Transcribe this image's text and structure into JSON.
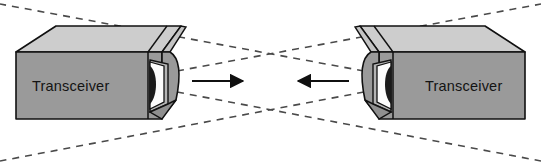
{
  "figure": {
    "width": 541,
    "height": 166,
    "background_color": "#ffffff"
  },
  "colors": {
    "background": "#ffffff",
    "box_top_face": "#cdcdcd",
    "box_front_face": "#9a9a9a",
    "box_side_face": "#8f8f8f",
    "box_inner_face": "#b4b4b4",
    "aperture_dark": "#1a1a1a",
    "aperture_light": "#fbfbfb",
    "outline": "#111111",
    "dashed_beam": "#4a4a4a",
    "arrow": "#101010",
    "label_text": "#141414"
  },
  "devices": [
    {
      "id": "transceiver-left",
      "label": "Transceiver",
      "position": "left",
      "facing": "right",
      "aperture": "horn-opening"
    },
    {
      "id": "transceiver-right",
      "label": "Transceiver",
      "position": "right",
      "facing": "left",
      "aperture": "horn-opening"
    }
  ],
  "arrows": [
    {
      "id": "beam-arrow-left",
      "direction": "right",
      "from_device": "transceiver-left",
      "style": "solid"
    },
    {
      "id": "beam-arrow-right",
      "direction": "left",
      "from_device": "transceiver-right",
      "style": "solid"
    }
  ],
  "beams": [
    {
      "id": "beam-left-upper",
      "source": "transceiver-left",
      "style": "dashed",
      "slope": "up-right"
    },
    {
      "id": "beam-left-lower",
      "source": "transceiver-left",
      "style": "dashed",
      "slope": "down-right"
    },
    {
      "id": "beam-right-upper",
      "source": "transceiver-right",
      "style": "dashed",
      "slope": "up-left"
    },
    {
      "id": "beam-right-lower",
      "source": "transceiver-right",
      "style": "dashed",
      "slope": "down-left"
    }
  ]
}
